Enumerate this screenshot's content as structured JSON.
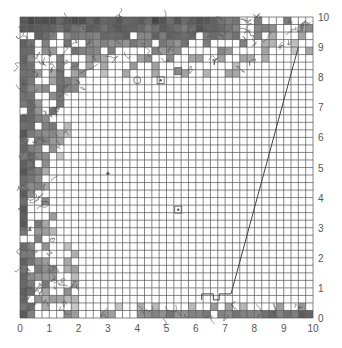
{
  "chart_data": {
    "type": "heatmap",
    "title": "",
    "xlabel": "",
    "ylabel": "",
    "xlim": [
      0,
      10
    ],
    "ylim": [
      0,
      10
    ],
    "grid": true,
    "grid_cells_per_unit": 4,
    "x_ticks": [
      "0",
      "1",
      "2",
      "3",
      "4",
      "5",
      "6",
      "7",
      "8",
      "9",
      "10"
    ],
    "y_ticks": [
      "0",
      "1",
      "2",
      "3",
      "4",
      "5",
      "6",
      "7",
      "8",
      "9",
      "10"
    ],
    "y_axis_position": "right",
    "line": {
      "points": [
        [
          6.2,
          0.6
        ],
        [
          6.2,
          0.8
        ],
        [
          6.6,
          0.8
        ],
        [
          6.6,
          0.6
        ],
        [
          6.8,
          0.6
        ],
        [
          6.8,
          0.8
        ],
        [
          7.2,
          0.8
        ],
        [
          9.5,
          9.0
        ]
      ]
    },
    "markers": [
      {
        "x": 3.0,
        "y": 4.8,
        "shape": "dot"
      },
      {
        "x": 5.4,
        "y": 3.6,
        "shape": "square"
      },
      {
        "x": 4.0,
        "y": 7.9,
        "shape": "circle"
      },
      {
        "x": 4.8,
        "y": 7.9,
        "shape": "square"
      },
      {
        "x": 5.4,
        "y": 8.2,
        "shape": "square-filled"
      }
    ],
    "colors": {
      "grid": "#555555",
      "shade_dark": "#6e6e6e",
      "shade_light": "#a8a8a8",
      "contour": "#555555"
    }
  }
}
